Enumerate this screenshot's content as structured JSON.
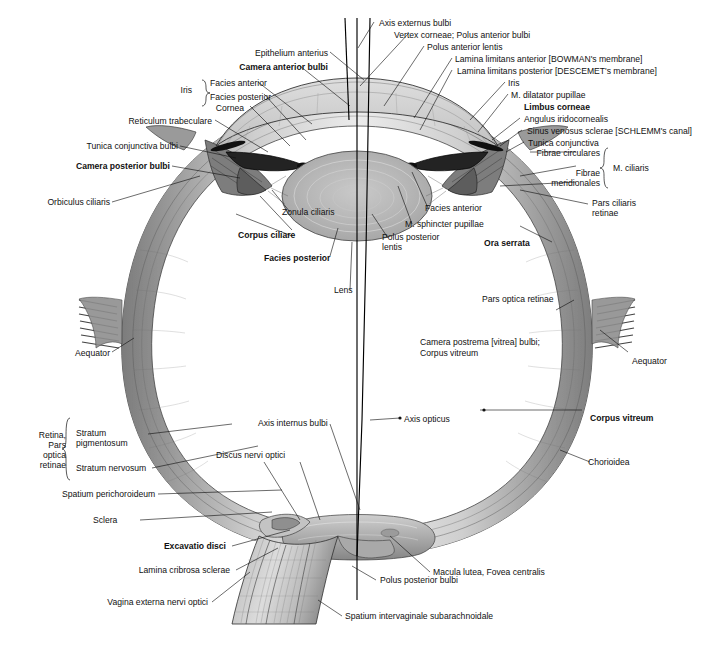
{
  "figure": {
    "colors": {
      "ink": "#111111",
      "sclera_light": "#d8d8d8",
      "sclera_mid": "#a8a8a8",
      "sclera_dark": "#6e6e6e",
      "choroid": "#8a8a8a",
      "retina": "#c4c4c4",
      "lens": "#b9b9b9",
      "cornea": "#d2d2d2",
      "iris": "#3a3a3a",
      "nerve": "#bdbdbd",
      "background": "#ffffff"
    }
  },
  "labels": {
    "axis_externus_bulbi": "Axis externus bulbi",
    "vertex_corneae": "Vertex corneae; Polus anterior bulbi",
    "polus_anterior_lentis": "Polus anterior lentis",
    "lamina_limitans_anterior": "Lamina limitans anterior [BOWMAN's membrane]",
    "lamina_limitans_posterior": "Lamina limitans posterior [DESCEMET's membrane]",
    "iris_right": "Iris",
    "m_dilatator_pupillae": "M. dilatator pupillae",
    "limbus_corneae": "Limbus corneae",
    "angulus_iridocornealis": "Angulus iridocornealis",
    "sinus_venosus_sclerae": "Sinus venosus sclerae [SCHLEMM's canal]",
    "tunica_conjunctiva": "Tunica conjunctiva",
    "fibrae_circulares": "Fibrae circulares",
    "fibrae_meridionales_1": "Fibrae",
    "fibrae_meridionales_2": "meridionales",
    "m_ciliaris": "M. ciliaris",
    "pars_ciliaris_retinae_1": "Pars ciliaris",
    "pars_ciliaris_retinae_2": "retinae",
    "epithelium_anterius": "Epithelium anterius",
    "camera_anterior_bulbi": "Camera anterior bulbi",
    "iris_left": "Iris",
    "facies_anterior_left": "Facies anterior",
    "facies_posterior_left": "Facies posterior",
    "cornea": "Cornea",
    "reticulum_trabeculare": "Reticulum trabeculare",
    "tunica_conjunctiva_bulbi": "Tunica conjunctiva bulbi",
    "camera_posterior_bulbi": "Camera posterior bulbi",
    "orbiculus_ciliaris": "Orbiculus ciliaris",
    "corpus_ciliare": "Corpus ciliare",
    "zonula_ciliaris": "Zonula ciliaris",
    "facies_posterior_lens": "Facies posterior",
    "lens": "Lens",
    "facies_anterior_right": "Facies anterior",
    "m_sphincter_pupillae": "M. sphincter pupillae",
    "polus_posterior_lentis_1": "Polus posterior",
    "polus_posterior_lentis_2": "lentis",
    "ora_serrata": "Ora serrata",
    "pars_optica_retinae_right": "Pars optica retinae",
    "camera_postrema_1": "Camera postrema [vitrea] bulbi;",
    "camera_postrema_2": "Corpus vitreum",
    "aequator_right": "Aequator",
    "aequator_left": "Aequator",
    "axis_opticus": "Axis opticus",
    "corpus_vitreum": "Corpus vitreum",
    "axis_internus_bulbi": "Axis internus bulbi",
    "discus_nervi_optici": "Discus nervi optici",
    "choroidea": "Chorioidea",
    "retina_pars_1": "Retina,",
    "retina_pars_2": "Pars",
    "retina_pars_3": "optica",
    "retina_pars_4": "retinae",
    "stratum_pigmentosum_1": "Stratum",
    "stratum_pigmentosum_2": "pigmentosum",
    "stratum_nervosum": "Stratum nervosum",
    "spatium_perichoroideum": "Spatium perichoroideum",
    "sclera": "Sclera",
    "excavatio_disci": "Excavatio disci",
    "lamina_cribrosa_sclerae": "Lamina cribrosa sclerae",
    "vagina_externa_nervi_optici": "Vagina externa nervi optici",
    "macula_lutea": "Macula lutea, Fovea centralis",
    "polus_posterior_bulbi": "Polus posterior bulbi",
    "spatium_intervaginale": "Spatium intervaginale subarachnoidale"
  }
}
